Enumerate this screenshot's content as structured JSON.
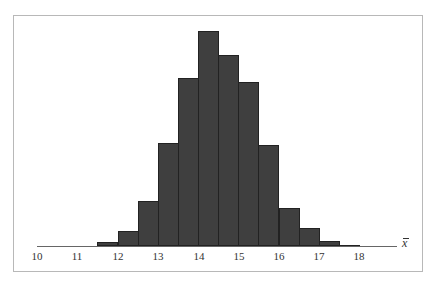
{
  "chart_data": {
    "type": "bar",
    "title": "",
    "xlabel": "x̄",
    "ylabel": "",
    "bin_width": 0.5,
    "bin_edges": [
      11.5,
      12,
      12.5,
      13,
      13.5,
      14,
      14.5,
      15,
      15.5,
      16,
      16.5,
      17,
      17.5,
      18
    ],
    "categories": [
      "11.5-12",
      "12-12.5",
      "12.5-13",
      "13-13.5",
      "13.5-14",
      "14-14.5",
      "14.5-15",
      "15-15.5",
      "15.5-16",
      "16-16.5",
      "16.5-17",
      "17-17.5",
      "17.5-18"
    ],
    "values": [
      4,
      15,
      45,
      103,
      168,
      215,
      191,
      164,
      101,
      38,
      18,
      5,
      1.5
    ],
    "values_note": "relative bar heights in pixels (no y-axis shown)",
    "xlim": [
      10,
      18.9
    ],
    "x_ticks": [
      "10",
      "11",
      "12",
      "13",
      "14",
      "15",
      "16",
      "17",
      "18"
    ],
    "grid": false,
    "legend": null
  },
  "axis": {
    "x_label": "x̄",
    "ticks": [
      {
        "label": "10",
        "x": 37
      },
      {
        "label": "11",
        "x": 77
      },
      {
        "label": "12",
        "x": 118
      },
      {
        "label": "13",
        "x": 158
      },
      {
        "label": "14",
        "x": 199
      },
      {
        "label": "15",
        "x": 239
      },
      {
        "label": "16",
        "x": 279
      },
      {
        "label": "17",
        "x": 319
      },
      {
        "label": "18",
        "x": 359
      }
    ]
  },
  "colors": {
    "bar_fill": "#3f3f3f",
    "bar_edge": "#222222",
    "frame": "#b8b8b8",
    "axis": "#666666"
  }
}
